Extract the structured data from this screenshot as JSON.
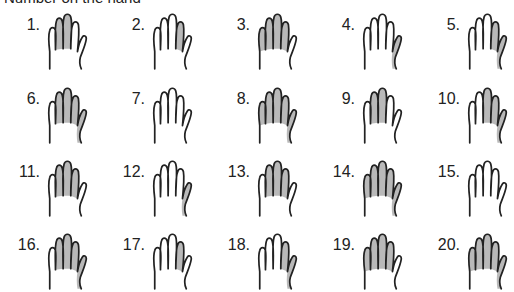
{
  "header": {
    "text": "Number on the hand"
  },
  "finger_order": [
    "pinky",
    "ring",
    "middle",
    "index",
    "thumb"
  ],
  "colors": {
    "shade": "#b9b9b9",
    "outline": "#222222"
  },
  "items": [
    {
      "label": "1.",
      "shaded": [
        0,
        1,
        1,
        0,
        0
      ]
    },
    {
      "label": "2.",
      "shaded": [
        0,
        0,
        0,
        1,
        0
      ]
    },
    {
      "label": "3.",
      "shaded": [
        1,
        1,
        1,
        1,
        0
      ]
    },
    {
      "label": "4.",
      "shaded": [
        0,
        0,
        0,
        0,
        1
      ]
    },
    {
      "label": "5.",
      "shaded": [
        0,
        0,
        0,
        1,
        1
      ]
    },
    {
      "label": "6.",
      "shaded": [
        0,
        1,
        1,
        1,
        1
      ]
    },
    {
      "label": "7.",
      "shaded": [
        0,
        0,
        0,
        0,
        0
      ]
    },
    {
      "label": "8.",
      "shaded": [
        1,
        1,
        1,
        1,
        1
      ]
    },
    {
      "label": "9.",
      "shaded": [
        0,
        1,
        1,
        0,
        0
      ]
    },
    {
      "label": "10.",
      "shaded": [
        0,
        0,
        1,
        1,
        1
      ]
    },
    {
      "label": "11.",
      "shaded": [
        0,
        1,
        1,
        1,
        0
      ]
    },
    {
      "label": "12.",
      "shaded": [
        0,
        0,
        0,
        0,
        1
      ]
    },
    {
      "label": "13.",
      "shaded": [
        0,
        1,
        1,
        1,
        0
      ]
    },
    {
      "label": "14.",
      "shaded": [
        1,
        1,
        1,
        1,
        1
      ]
    },
    {
      "label": "15.",
      "shaded": [
        0,
        0,
        0,
        0,
        0
      ]
    },
    {
      "label": "16.",
      "shaded": [
        0,
        1,
        1,
        1,
        1
      ]
    },
    {
      "label": "17.",
      "shaded": [
        0,
        0,
        0,
        1,
        0
      ]
    },
    {
      "label": "18.",
      "shaded": [
        0,
        0,
        0,
        1,
        1
      ]
    },
    {
      "label": "19.",
      "shaded": [
        1,
        1,
        1,
        1,
        0
      ]
    },
    {
      "label": "20.",
      "shaded": [
        1,
        1,
        1,
        1,
        1
      ]
    }
  ]
}
